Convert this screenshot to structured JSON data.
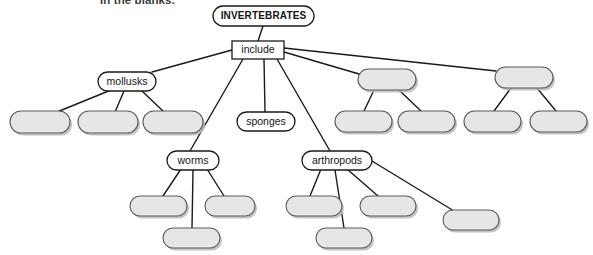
{
  "page": {
    "partial_instruction": "in the blanks.",
    "background_color": "#ffffff"
  },
  "colors": {
    "blank_fill": "#e6e6e6",
    "blank_stroke": "#5a5a5a",
    "label_fill": "#ffffff",
    "label_stroke": "#1a1a1a",
    "edge": "#1a1a1a",
    "text": "#141414",
    "shadow": "#b9b9b9"
  },
  "diagram": {
    "type": "concept-map",
    "root": {
      "id": "root",
      "label": "INVERTEBRATES",
      "shape": "rounded-pill",
      "filled": false,
      "x": 213,
      "y": 6,
      "w": 101,
      "h": 20,
      "rx": 10
    },
    "connector": {
      "id": "include",
      "label": "include",
      "shape": "rectangle",
      "filled": false,
      "x": 232,
      "y": 41,
      "w": 52,
      "h": 18,
      "rx": 0
    },
    "branches": [
      {
        "id": "mollusks",
        "label": "mollusks",
        "shape": "rounded-pill",
        "filled": false,
        "x": 98,
        "y": 72,
        "w": 58,
        "h": 19,
        "rx": 9.5,
        "children": [
          {
            "id": "mollusks-child-1",
            "label": "",
            "x": 10,
            "y": 111,
            "w": 60,
            "h": 22,
            "rx": 11
          },
          {
            "id": "mollusks-child-2",
            "label": "",
            "x": 78,
            "y": 111,
            "w": 60,
            "h": 22,
            "rx": 11
          },
          {
            "id": "mollusks-child-3",
            "label": "",
            "x": 143,
            "y": 111,
            "w": 60,
            "h": 22,
            "rx": 11
          }
        ]
      },
      {
        "id": "worms",
        "label": "worms",
        "shape": "rounded-pill",
        "filled": false,
        "x": 167,
        "y": 151,
        "w": 52,
        "h": 19,
        "rx": 9.5,
        "children": [
          {
            "id": "worms-child-1",
            "label": "",
            "x": 130,
            "y": 196,
            "w": 57,
            "h": 20,
            "rx": 10
          },
          {
            "id": "worms-child-2",
            "label": "",
            "x": 205,
            "y": 196,
            "w": 50,
            "h": 20,
            "rx": 10
          },
          {
            "id": "worms-child-3",
            "label": "",
            "x": 163,
            "y": 228,
            "w": 57,
            "h": 20,
            "rx": 10
          }
        ]
      },
      {
        "id": "sponges",
        "label": "sponges",
        "shape": "rounded-pill",
        "filled": false,
        "x": 237,
        "y": 112,
        "w": 58,
        "h": 19,
        "rx": 9.5,
        "children": []
      },
      {
        "id": "arthropods",
        "label": "arthropods",
        "shape": "rounded-pill",
        "filled": false,
        "x": 302,
        "y": 151,
        "w": 70,
        "h": 19,
        "rx": 9.5,
        "children": [
          {
            "id": "arthropods-child-1",
            "label": "",
            "x": 286,
            "y": 196,
            "w": 56,
            "h": 20,
            "rx": 10
          },
          {
            "id": "arthropods-child-2",
            "label": "",
            "x": 360,
            "y": 196,
            "w": 56,
            "h": 20,
            "rx": 10
          },
          {
            "id": "arthropods-child-3",
            "label": "",
            "x": 443,
            "y": 210,
            "w": 56,
            "h": 20,
            "rx": 10
          },
          {
            "id": "arthropods-child-4",
            "label": "",
            "x": 316,
            "y": 228,
            "w": 56,
            "h": 20,
            "rx": 10
          }
        ]
      },
      {
        "id": "blank-branch-1",
        "label": "",
        "shape": "rounded-pill",
        "filled": true,
        "x": 358,
        "y": 69,
        "w": 58,
        "h": 21,
        "rx": 10.5,
        "children": [
          {
            "id": "blank-branch-1-child-1",
            "label": "",
            "x": 335,
            "y": 111,
            "w": 57,
            "h": 21,
            "rx": 10.5
          },
          {
            "id": "blank-branch-1-child-2",
            "label": "",
            "x": 398,
            "y": 111,
            "w": 57,
            "h": 21,
            "rx": 10.5
          }
        ]
      },
      {
        "id": "blank-branch-2",
        "label": "",
        "shape": "rounded-pill",
        "filled": true,
        "x": 495,
        "y": 67,
        "w": 58,
        "h": 21,
        "rx": 10.5,
        "children": [
          {
            "id": "blank-branch-2-child-1",
            "label": "",
            "x": 464,
            "y": 111,
            "w": 57,
            "h": 21,
            "rx": 10.5
          },
          {
            "id": "blank-branch-2-child-2",
            "label": "",
            "x": 530,
            "y": 111,
            "w": 57,
            "h": 21,
            "rx": 10.5
          }
        ]
      }
    ],
    "edges": [
      {
        "from": "root",
        "to": "include",
        "x1": 263,
        "y1": 26,
        "x2": 258,
        "y2": 41
      },
      {
        "from": "include",
        "to": "mollusks",
        "x1": 232,
        "y1": 50,
        "x2": 152,
        "y2": 72
      },
      {
        "from": "include",
        "to": "worms",
        "x1": 243,
        "y1": 59,
        "x2": 190,
        "y2": 151
      },
      {
        "from": "include",
        "to": "sponges",
        "x1": 264,
        "y1": 59,
        "x2": 265,
        "y2": 112
      },
      {
        "from": "include",
        "to": "arthropods",
        "x1": 277,
        "y1": 59,
        "x2": 330,
        "y2": 151
      },
      {
        "from": "include",
        "to": "blank-branch-1",
        "x1": 284,
        "y1": 52,
        "x2": 359,
        "y2": 74
      },
      {
        "from": "include",
        "to": "blank-branch-2",
        "x1": 284,
        "y1": 48,
        "x2": 496,
        "y2": 71
      },
      {
        "from": "mollusks",
        "to": "mollusks-child-1",
        "x1": 111,
        "y1": 90,
        "x2": 57,
        "y2": 112
      },
      {
        "from": "mollusks",
        "to": "mollusks-child-2",
        "x1": 124,
        "y1": 91,
        "x2": 115,
        "y2": 112
      },
      {
        "from": "mollusks",
        "to": "mollusks-child-3",
        "x1": 142,
        "y1": 91,
        "x2": 164,
        "y2": 112
      },
      {
        "from": "worms",
        "to": "worms-child-1",
        "x1": 181,
        "y1": 169,
        "x2": 163,
        "y2": 196
      },
      {
        "from": "worms",
        "to": "worms-child-2",
        "x1": 207,
        "y1": 169,
        "x2": 224,
        "y2": 196
      },
      {
        "from": "worms",
        "to": "worms-child-3",
        "x1": 193,
        "y1": 170,
        "x2": 192,
        "y2": 228
      },
      {
        "from": "arthropods",
        "to": "arthropods-child-1",
        "x1": 321,
        "y1": 169,
        "x2": 310,
        "y2": 196
      },
      {
        "from": "arthropods",
        "to": "arthropods-child-2",
        "x1": 347,
        "y1": 169,
        "x2": 378,
        "y2": 196
      },
      {
        "from": "arthropods",
        "to": "arthropods-child-3",
        "x1": 372,
        "y1": 161,
        "x2": 454,
        "y2": 211
      },
      {
        "from": "arthropods",
        "to": "arthropods-child-4",
        "x1": 335,
        "y1": 170,
        "x2": 344,
        "y2": 228
      },
      {
        "from": "blank-branch-1",
        "to": "blank-branch-1-child-1",
        "x1": 374,
        "y1": 90,
        "x2": 364,
        "y2": 111
      },
      {
        "from": "blank-branch-1",
        "to": "blank-branch-1-child-2",
        "x1": 399,
        "y1": 90,
        "x2": 421,
        "y2": 111
      },
      {
        "from": "blank-branch-2",
        "to": "blank-branch-2-child-1",
        "x1": 511,
        "y1": 88,
        "x2": 494,
        "y2": 111
      },
      {
        "from": "blank-branch-2",
        "to": "blank-branch-2-child-2",
        "x1": 537,
        "y1": 88,
        "x2": 556,
        "y2": 111
      }
    ]
  }
}
